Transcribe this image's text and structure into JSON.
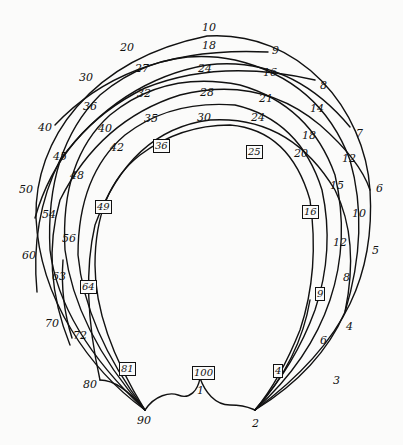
{
  "diagram": {
    "stroke_color": "#111111",
    "background": "#fbfbfa",
    "curves": [
      "M145,410 C90,370 40,300 36,218 C34,140 90,60 207,36 C300,30 365,110 370,190 C375,270 350,340 255,410",
      "M145,410 Q60,330 50,250 Q45,150 100,95 Q160,45 235,60 Q320,80 350,160 Q370,230 345,312 Q320,370 255,410",
      "M145,410 Q75,330 65,250 Q60,160 110,115 Q165,70 240,85 Q310,105 335,175 Q350,240 330,300 Q310,360 255,410",
      "M145,410 Q85,330 78,255 Q78,175 125,135 Q170,100 235,105 Q300,120 322,190 Q335,250 315,310 Q295,365 255,410",
      "M145,410 Q95,330 95,265 Q95,190 140,155 Q180,125 230,125 Q290,130 310,200 Q320,270 300,330 Q280,380 255,410",
      "M100,380 Q80,290 95,225 Q130,130 210,120 Q290,115 335,190 Q360,240 345,312",
      "M70,345 Q40,270 60,200 Q100,120 180,95 Q260,75 320,125 Q360,160 370,190",
      "M37,292 Q30,220 60,160 Q120,80 207,65 Q290,55 350,127",
      "M35,218 Q60,130 145,88 Q220,58 315,80",
      "M55,125 Q130,45 268,52",
      "M145,410 Q120,380 100,380",
      "M145,410 C155,395 170,392 178,395 C190,400 198,390 200,378 C205,392 215,405 230,405 C245,405 250,408 255,410",
      "M72,338 Q60,300 63,260",
      "M255,410 Q300,360 310,300"
    ],
    "labels": [
      {
        "text": "10",
        "x": 202,
        "y": 22
      },
      {
        "text": "20",
        "x": 120,
        "y": 42
      },
      {
        "text": "18",
        "x": 202,
        "y": 40
      },
      {
        "text": "9",
        "x": 272,
        "y": 45
      },
      {
        "text": "30",
        "x": 79,
        "y": 72
      },
      {
        "text": "27",
        "x": 135,
        "y": 63
      },
      {
        "text": "24",
        "x": 198,
        "y": 63
      },
      {
        "text": "16",
        "x": 263,
        "y": 67
      },
      {
        "text": "8",
        "x": 320,
        "y": 80
      },
      {
        "text": "36",
        "x": 83,
        "y": 101
      },
      {
        "text": "32",
        "x": 137,
        "y": 88
      },
      {
        "text": "28",
        "x": 200,
        "y": 87
      },
      {
        "text": "21",
        "x": 259,
        "y": 93
      },
      {
        "text": "14",
        "x": 310,
        "y": 103
      },
      {
        "text": "40",
        "x": 38,
        "y": 122
      },
      {
        "text": "40",
        "x": 98,
        "y": 123
      },
      {
        "text": "35",
        "x": 144,
        "y": 113
      },
      {
        "text": "30",
        "x": 197,
        "y": 112
      },
      {
        "text": "24",
        "x": 251,
        "y": 112
      },
      {
        "text": "18",
        "x": 302,
        "y": 130
      },
      {
        "text": "7",
        "x": 356,
        "y": 128
      },
      {
        "text": "42",
        "x": 110,
        "y": 142
      },
      {
        "text": "20",
        "x": 294,
        "y": 148
      },
      {
        "text": "12",
        "x": 342,
        "y": 153
      },
      {
        "text": "45",
        "x": 53,
        "y": 151
      },
      {
        "text": "48",
        "x": 70,
        "y": 170
      },
      {
        "text": "15",
        "x": 330,
        "y": 180
      },
      {
        "text": "6",
        "x": 376,
        "y": 183
      },
      {
        "text": "50",
        "x": 19,
        "y": 184
      },
      {
        "text": "54",
        "x": 42,
        "y": 209
      },
      {
        "text": "10",
        "x": 352,
        "y": 208
      },
      {
        "text": "56",
        "x": 62,
        "y": 233
      },
      {
        "text": "12",
        "x": 333,
        "y": 237
      },
      {
        "text": "5",
        "x": 372,
        "y": 245
      },
      {
        "text": "60",
        "x": 22,
        "y": 250
      },
      {
        "text": "63",
        "x": 52,
        "y": 271
      },
      {
        "text": "8",
        "x": 343,
        "y": 272
      },
      {
        "text": "70",
        "x": 45,
        "y": 318
      },
      {
        "text": "4",
        "x": 346,
        "y": 321
      },
      {
        "text": "72",
        "x": 73,
        "y": 330
      },
      {
        "text": "6",
        "x": 320,
        "y": 335
      },
      {
        "text": "3",
        "x": 333,
        "y": 375
      },
      {
        "text": "80",
        "x": 83,
        "y": 379
      },
      {
        "text": "1",
        "x": 197,
        "y": 385
      },
      {
        "text": "90",
        "x": 137,
        "y": 415
      },
      {
        "text": "2",
        "x": 252,
        "y": 418
      }
    ],
    "boxed_labels": [
      {
        "text": "36",
        "x": 153,
        "y": 139
      },
      {
        "text": "25",
        "x": 246,
        "y": 145
      },
      {
        "text": "49",
        "x": 95,
        "y": 200
      },
      {
        "text": "16",
        "x": 302,
        "y": 205
      },
      {
        "text": "64",
        "x": 80,
        "y": 280
      },
      {
        "text": "9",
        "x": 315,
        "y": 287
      },
      {
        "text": "81",
        "x": 119,
        "y": 362
      },
      {
        "text": "100",
        "x": 192,
        "y": 366
      },
      {
        "text": "4",
        "x": 273,
        "y": 364
      }
    ]
  }
}
